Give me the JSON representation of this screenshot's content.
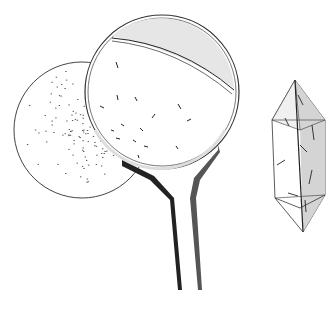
{
  "illustration": {
    "subject": "magnifying lens over speckled disc beside a doubly terminated prism crystal",
    "colors": {
      "background": "#ffffff",
      "ink": "#222222",
      "shade": "#cfcfcf",
      "light_shade": "#ececec"
    },
    "elements": [
      {
        "id": "speckled-disc",
        "label": "circular sample with stippled inclusions"
      },
      {
        "id": "magnifier",
        "label": "round lens on forked handle"
      },
      {
        "id": "crystal",
        "label": "hexagonal prism crystal with pyramidal terminations and needle inclusions"
      }
    ]
  }
}
